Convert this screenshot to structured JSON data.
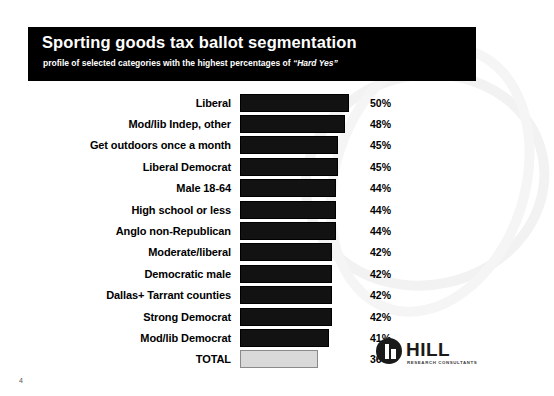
{
  "slide": {
    "title": "Sporting goods tax ballot segmentation",
    "subtitle_prefix": "profile of selected categories with the highest percentages of ",
    "subtitle_quoted": "“Hard Yes”",
    "page_number": "4"
  },
  "logo": {
    "wordmark": "HILL",
    "tagline": "RESEARCH CONSULTANTS"
  },
  "chart_data": {
    "type": "bar",
    "title": "Sporting goods tax ballot segmentation",
    "subtitle": "profile of selected categories with the highest percentages of “Hard Yes”",
    "xlabel": "",
    "ylabel": "",
    "xlim": [
      0,
      56
    ],
    "grid": false,
    "legend": null,
    "orientation": "horizontal",
    "categories": [
      "Liberal",
      "Mod/lib Indep, other",
      "Get outdoors once a month",
      "Liberal Democrat",
      "Male 18-64",
      "High school or less",
      "Anglo non-Republican",
      "Moderate/liberal",
      "Democratic male",
      "Dallas+ Tarrant counties",
      "Strong Democrat",
      "Mod/lib Democrat",
      "TOTAL"
    ],
    "values": [
      50,
      48,
      45,
      45,
      44,
      44,
      44,
      42,
      42,
      42,
      42,
      41,
      36
    ],
    "value_labels": [
      "50%",
      "48%",
      "45%",
      "45%",
      "44%",
      "44%",
      "44%",
      "42%",
      "42%",
      "42%",
      "42%",
      "41%",
      "36%"
    ],
    "colors": {
      "bar": "#121212",
      "total_bar": "#d9d9d9",
      "header_band": "#000000",
      "header_text": "#ffffff",
      "text": "#000000"
    }
  }
}
